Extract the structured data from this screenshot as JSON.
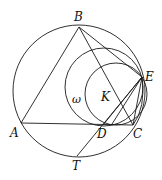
{
  "diagram": {
    "labels": {
      "B": "B",
      "E": "E",
      "omega": "ω",
      "K": "K",
      "A": "A",
      "D": "D",
      "C": "C",
      "T": "T"
    },
    "stroke_color": "#1a1a1a"
  }
}
